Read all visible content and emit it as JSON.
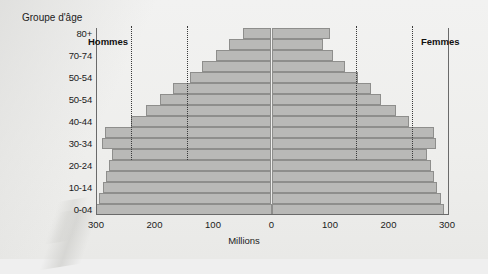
{
  "chart_data": {
    "type": "bar",
    "subtype": "population-pyramid",
    "title": "",
    "xlabel": "Millions",
    "ylabel": "Groupe d'âge",
    "xlim": [
      -300,
      300
    ],
    "xticks": [
      {
        "value": -300,
        "label": "300"
      },
      {
        "value": -200,
        "label": "200"
      },
      {
        "value": -100,
        "label": "100"
      },
      {
        "value": 0,
        "label": "0"
      },
      {
        "value": 100,
        "label": "100"
      },
      {
        "value": 200,
        "label": "200"
      },
      {
        "value": 300,
        "label": "300"
      }
    ],
    "grid": false,
    "legend_position": "inside-top",
    "series": [
      {
        "name": "Hommes",
        "side": "left"
      },
      {
        "name": "Femmes",
        "side": "right"
      }
    ],
    "guides": [
      -240,
      -145,
      145,
      240
    ],
    "categories": [
      "0-04",
      "05-09",
      "10-14",
      "15-19",
      "20-24",
      "25-29",
      "30-34",
      "35-39",
      "40-44",
      "45-49",
      "50-54",
      "55-59",
      "60-64",
      "65-69",
      "70-74",
      "75-79",
      "80+"
    ],
    "y_tick_labels": [
      {
        "category": "0-04",
        "label": "0-04"
      },
      {
        "category": "10-14",
        "label": "10-14"
      },
      {
        "category": "20-24",
        "label": "20-24"
      },
      {
        "category": "30-34",
        "label": "30-34"
      },
      {
        "category": "40-44",
        "label": "40-44"
      },
      {
        "category": "50-54",
        "label": "50-54"
      },
      {
        "category": "60-64",
        "label": "50-54"
      },
      {
        "category": "70-74",
        "label": "70-74"
      },
      {
        "category": "80+",
        "label": "80+"
      }
    ],
    "hommes": [
      300,
      295,
      288,
      283,
      278,
      272,
      290,
      285,
      240,
      215,
      190,
      168,
      140,
      118,
      95,
      72,
      48
    ],
    "femmes": [
      295,
      290,
      283,
      278,
      272,
      265,
      282,
      278,
      235,
      212,
      188,
      170,
      148,
      125,
      105,
      88,
      100
    ],
    "bar_fill": "#b9b9b7",
    "bar_stroke": "#8e8e8c",
    "axis_color": "#6a6a6a",
    "text_color": "#1b1b1b",
    "background": "#eeeeec"
  },
  "labels": {
    "y_axis_title": "Groupe d'âge",
    "x_axis_title": "Millions",
    "hommes": "Hommes",
    "femmes": "Femmes"
  }
}
